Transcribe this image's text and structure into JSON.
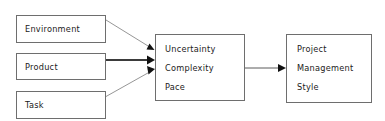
{
  "figure": {
    "background_color": "#ffffff",
    "border_color": "#6e6e6e",
    "text_color": "#1b1b1b",
    "arrow_color": "#111111"
  },
  "top_rule": {
    "name": "page-top-rule",
    "color": "#9a9a9a"
  },
  "inputs": {
    "environment": {
      "label": "Environment",
      "x": 16,
      "y": 15,
      "w": 89,
      "h": 27
    },
    "product": {
      "label": "Product",
      "x": 16,
      "y": 53,
      "w": 89,
      "h": 26
    },
    "task": {
      "label": "Task",
      "x": 16,
      "y": 91,
      "w": 89,
      "h": 27
    }
  },
  "center": {
    "name": "uncertainty-complexity-pace-box",
    "x": 155,
    "y": 34,
    "w": 89,
    "h": 66,
    "lines": [
      "Uncertainty",
      "Complexity",
      "Pace"
    ]
  },
  "output": {
    "name": "project-management-style-box",
    "x": 286,
    "y": 34,
    "w": 85,
    "h": 68,
    "lines": [
      "Project",
      "Management",
      "Style"
    ]
  },
  "edges": [
    {
      "name": "environment-to-center-arrow",
      "from": "Environment",
      "to": "Uncertainty Complexity Pace",
      "style": "thin",
      "path": "M 106 20 L 150 48"
    },
    {
      "name": "product-to-center-arrow",
      "from": "Product",
      "to": "Uncertainty Complexity Pace",
      "style": "thick",
      "path": "M 106 60 L 149 60"
    },
    {
      "name": "task-to-center-arrow",
      "from": "Task",
      "to": "Uncertainty Complexity Pace",
      "style": "thin",
      "path": "M 106 96 L 150 71"
    },
    {
      "name": "center-to-output-arrow",
      "from": "Uncertainty Complexity Pace",
      "to": "Project Management Style",
      "style": "medium",
      "path": "M 245 68 L 281 68"
    }
  ]
}
